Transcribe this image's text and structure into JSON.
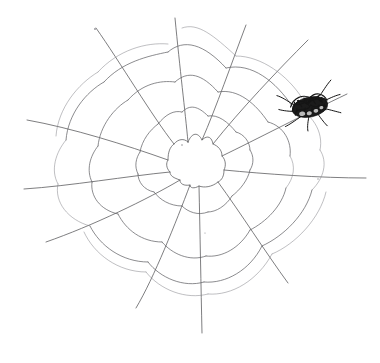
{
  "artwork": {
    "title": "Hand-drawn spider web with spider",
    "medium": "pen sketch on white paper",
    "background_color": "#ffffff",
    "ink_color": "#5a5a5c",
    "spider_color": "#151515",
    "canvas": {
      "width": 380,
      "height": 363
    }
  },
  "web": {
    "center": {
      "x": 196,
      "y": 166
    },
    "hub_outline": "M 170 140 L 184 135 L 196 140 L 208 136 L 219 146 L 226 160 L 223 175 L 212 183 L 198 186 L 184 182 L 173 174 L 167 160 Z",
    "radials": [
      {
        "name": "radial-n",
        "angle_deg": -92,
        "end": {
          "x": 175,
          "y": 18
        },
        "path": "M 188 142 C 185 110 180 70 175 18"
      },
      {
        "name": "radial-nne",
        "angle_deg": -62,
        "end": {
          "x": 245,
          "y": 25
        },
        "path": "M 202 140 C 216 108 232 62 246 25"
      },
      {
        "name": "radial-ne",
        "angle_deg": -38,
        "end": {
          "x": 307,
          "y": 40
        },
        "path": "M 213 144 C 240 110 278 70 308 40"
      },
      {
        "name": "radial-ene",
        "angle_deg": -18,
        "end": {
          "x": 347,
          "y": 94
        },
        "path": "M 222 156 C 255 140 305 114 347 94"
      },
      {
        "name": "radial-e",
        "angle_deg": 4,
        "end": {
          "x": 366,
          "y": 178
        },
        "path": "M 224 170 C 265 174 320 178 366 178"
      },
      {
        "name": "radial-ese",
        "angle_deg": 36,
        "end": {
          "x": 288,
          "y": 283
        },
        "path": "M 218 182 C 240 212 266 253 288 283"
      },
      {
        "name": "radial-s",
        "angle_deg": 88,
        "end": {
          "x": 202,
          "y": 333
        },
        "path": "M 199 186 C 200 230 201 288 202 333"
      },
      {
        "name": "radial-ssw",
        "angle_deg": 112,
        "end": {
          "x": 136,
          "y": 308
        },
        "path": "M 190 185 C 176 222 154 278 136 308"
      },
      {
        "name": "radial-sw",
        "angle_deg": 143,
        "end": {
          "x": 46,
          "y": 242
        },
        "path": "M 180 180 C 148 199 92 226 46 242"
      },
      {
        "name": "radial-w",
        "angle_deg": 177,
        "end": {
          "x": 24,
          "y": 189
        },
        "path": "M 170 172 C 128 176 70 186 24 189"
      },
      {
        "name": "radial-wnw",
        "angle_deg": 200,
        "end": {
          "x": 27,
          "y": 120
        },
        "path": "M 168 160 C 126 145 72 128 27 120"
      },
      {
        "name": "radial-nw",
        "angle_deg": 230,
        "end": {
          "x": 96,
          "y": 28
        },
        "path": "M 174 144 C 152 116 120 62 96 28"
      }
    ],
    "rings": [
      {
        "name": "ring-1",
        "segments": [
          "M 188 142 C 192 132 198 132 202 140",
          "M 202 140 C 208 134 212 138 213 144",
          "M 213 144 C 218 146 222 150 222 156",
          "M 222 156 C 226 160 226 166 224 170",
          "M 224 170 C 224 176 222 180 218 182",
          "M 218 182 C 212 187 204 188 199 186",
          "M 199 186 C 194 189 190 188 190 185",
          "M 190 185 C 184 186 180 184 180 180",
          "M 180 180 C 174 178 170 176 170 172",
          "M 170 172 C 166 168 166 163 168 160",
          "M 168 160 C 168 152 170 147 174 144",
          "M 174 144 C 178 139 184 138 188 142"
        ]
      },
      {
        "name": "ring-2",
        "segments": [
          "M 182 112 C 190 104 198 106 208 116",
          "M 208 116 C 218 114 228 122 236 132",
          "M 236 132 C 244 134 250 142 250 150",
          "M 250 150 C 254 156 254 164 250 170",
          "M 250 170 C 248 180 240 190 232 196",
          "M 232 196 C 226 206 216 212 208 212",
          "M 208 212 C 198 216 188 212 182 206",
          "M 182 206 C 170 206 160 200 154 192",
          "M 154 192 C 144 190 138 182 138 174",
          "M 138 174 C 134 166 136 158 140 152",
          "M 140 152 C 142 140 150 130 158 124",
          "M 158 124 C 166 114 174 110 182 112"
        ]
      },
      {
        "name": "ring-3",
        "segments": [
          "M 175 82 C 188 70 202 74 218 92",
          "M 218 92 C 238 88 256 104 268 122",
          "M 268 122 C 284 126 292 142 290 156",
          "M 290 156 C 296 166 294 178 286 188",
          "M 286 188 C 282 206 266 222 250 230",
          "M 250 230 C 240 248 222 258 206 256",
          "M 206 256 C 190 262 172 254 162 242",
          "M 162 242 C 142 242 126 230 118 214",
          "M 118 214 C 100 210 90 196 92 182",
          "M 92 182 C 86 170 90 156 98 146",
          "M 98 146 C 100 126 114 108 128 100",
          "M 128 100 C 142 84 160 80 175 82"
        ]
      },
      {
        "name": "ring-4",
        "segments": [
          "M 168 52 C 184 38 204 44 226 68",
          "M 226 68 C 252 62 276 82 292 106",
          "M 292 106 C 312 112 324 132 320 150",
          "M 320 150 C 328 162 324 178 312 190",
          "M 312 190 C 306 214 284 236 262 246",
          "M 262 246 C 250 270 226 284 204 282",
          "M 204 282 C 184 288 160 278 148 262",
          "M 148 262 C 122 262 100 246 90 226",
          "M 90 226 C 68 220 54 202 58 184",
          "M 58 184 C 50 170 56 152 66 140",
          "M 66 140 C 68 114 86 92 104 82",
          "M 104 82 C 122 62 148 56 168 52"
        ]
      },
      {
        "name": "ring-5",
        "segments": [
          "M 182 28 C 198 22 214 36 236 56",
          "M 236 56 C 262 56 288 76 302 98",
          "M 302 98 C 326 106 340 128 336 146",
          "M 336 146 C 346 160 340 180 326 192",
          "M 326 192 C 320 218 296 244 272 254",
          "M 272 254 C 258 280 232 296 208 294",
          "M 208 294 C 186 300 160 290 146 272",
          "M 146 272 C 118 272 94 254 84 232",
          "M 84 232 C 60 226 44 206 48 186",
          "M 48 186 C 40 170 46 150 56 136",
          "M 56 136 C 58 108 78 84 98 72",
          "M 98 72 C 118 50 146 42 168 44"
        ]
      }
    ]
  },
  "spider": {
    "name": "spider",
    "position": {
      "x": 310,
      "y": 107
    },
    "body_width": 38,
    "body_height": 22,
    "color": "#151515",
    "legs": 8
  },
  "specks": [
    {
      "x": 95,
      "y": 29,
      "r": 0.9
    },
    {
      "x": 182,
      "y": 145,
      "r": 0.8
    },
    {
      "x": 318,
      "y": 179,
      "r": 0.7
    },
    {
      "x": 205,
      "y": 233,
      "r": 0.6
    },
    {
      "x": 138,
      "y": 175,
      "r": 0.6
    }
  ]
}
